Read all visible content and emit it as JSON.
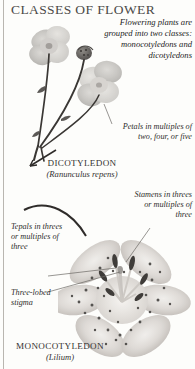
{
  "page": {
    "title": "CLASSES OF FLOWER",
    "background_color": "#fdfdfb",
    "rule_color": "#b9b6b0",
    "text_color": "#2b2b2b"
  },
  "intro": {
    "text": "Flowering plants are grouped into two classes: monocotyledons and dicotyledons"
  },
  "captions": {
    "petals": "Petals in multiples of two, four, or five",
    "stamens": "Stamens in threes or multiples of three",
    "tepals": "Tepals in threes or multiples of three",
    "stigma": "Three-lobed stigma"
  },
  "specimens": [
    {
      "class_name": "DICOTYLEDON",
      "scientific_name": "(Ranunculus repens)",
      "common": "buttercup"
    },
    {
      "class_name": "MONOCOTYLEDON",
      "scientific_name": "(Lilium)",
      "common": "lily"
    }
  ],
  "artwork": {
    "buttercup_label": "pressed-buttercup-specimen",
    "lily_label": "lily-flower-photograph"
  }
}
